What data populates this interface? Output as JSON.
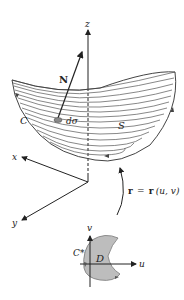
{
  "figure": {
    "axes3d": {
      "x_label": "x",
      "y_label": "y",
      "z_label": "z"
    },
    "surface": {
      "surface_label": "S",
      "boundary_label": "C",
      "normal_label": "N",
      "area_element_label": "dσ"
    },
    "mapping": {
      "lhs": "r",
      "equals": "=",
      "rhs_func": "r",
      "rhs_args": "(u, v)"
    },
    "param_domain": {
      "u_label": "u",
      "v_label": "v",
      "region_label": "D",
      "boundary_label": "C*"
    },
    "colors": {
      "ink": "#222222",
      "surface_lines": "#555555",
      "region_fill": "#bdbdbd",
      "area_patch": "#8a8a8a"
    }
  }
}
